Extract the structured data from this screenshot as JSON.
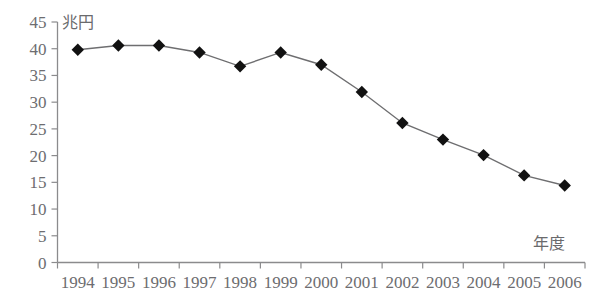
{
  "chart_data": {
    "type": "line",
    "title": "",
    "subtitle": "",
    "xlabel": "年度",
    "ylabel": "兆円",
    "categories": [
      "1994",
      "1995",
      "1996",
      "1997",
      "1998",
      "1999",
      "2000",
      "2001",
      "2002",
      "2003",
      "2004",
      "2005",
      "2006"
    ],
    "values": [
      39.8,
      40.6,
      40.6,
      39.3,
      36.7,
      39.3,
      37.0,
      31.9,
      26.1,
      23.0,
      20.1,
      16.3,
      14.4
    ],
    "series": [
      {
        "name": "",
        "values": [
          39.8,
          40.6,
          40.6,
          39.3,
          36.7,
          39.3,
          37.0,
          31.9,
          26.1,
          23.0,
          20.1,
          16.3,
          14.4
        ]
      }
    ],
    "ylim": [
      0,
      45
    ],
    "yticks": [
      0,
      5,
      10,
      15,
      20,
      25,
      30,
      35,
      40,
      45
    ],
    "ytick_labels": [
      "0",
      "5",
      "10",
      "15",
      "20",
      "25",
      "30",
      "35",
      "40",
      "45"
    ],
    "xtick_labels": [
      "1994",
      "1995",
      "1996",
      "1997",
      "1998",
      "1999",
      "2000",
      "2001",
      "2002",
      "2003",
      "2004",
      "2005",
      "2006"
    ],
    "grid": false,
    "legend": "none",
    "marker": "diamond",
    "marker_color": "#111111",
    "line_color": "#6e6e70",
    "axis_color": "#8b8b8d",
    "background": "#ffffff"
  },
  "axes": {
    "y_unit_label": "兆円",
    "x_unit_label": "年度"
  }
}
